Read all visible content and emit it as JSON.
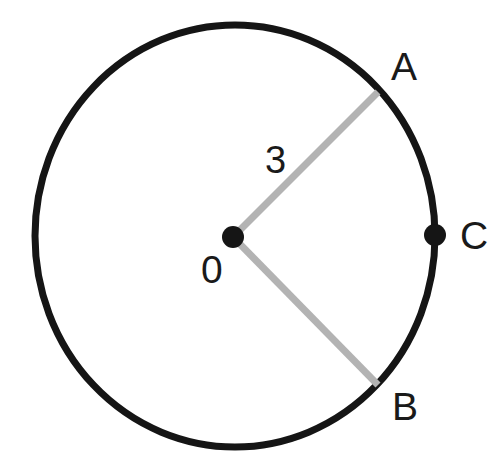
{
  "figure": {
    "type": "geometry-diagram",
    "background_color": "#ffffff"
  },
  "colors": {
    "circle_stroke": "#151515",
    "radius_stroke": "#b3b3b3",
    "point_fill": "#151515",
    "label_color": "#1a1a1a"
  },
  "circle": {
    "center_x": 235,
    "center_y": 236,
    "radius_x": 200,
    "radius_y": 211,
    "stroke_width": 7
  },
  "points": {
    "center": {
      "name": "O",
      "label": "0",
      "x": 233,
      "y": 237,
      "dot_radius": 11,
      "label_x": 213,
      "label_y": 270
    },
    "a": {
      "name": "A",
      "label": "A",
      "x": 378,
      "y": 92,
      "label_x": 404,
      "label_y": 66
    },
    "b": {
      "name": "B",
      "label": "B",
      "x": 378,
      "y": 385,
      "label_x": 404,
      "label_y": 406
    },
    "c": {
      "name": "C",
      "label": "C",
      "x": 435,
      "y": 235,
      "dot_radius": 11,
      "label_x": 472,
      "label_y": 235
    }
  },
  "segments": [
    {
      "name": "radius-OA",
      "from": "O",
      "to": "A",
      "x1": 233,
      "y1": 237,
      "x2": 378,
      "y2": 92,
      "stroke_width": 7,
      "length_label": "3"
    },
    {
      "name": "radius-OB",
      "from": "O",
      "to": "B",
      "x1": 233,
      "y1": 237,
      "x2": 378,
      "y2": 385,
      "stroke_width": 7,
      "length_label": ""
    }
  ],
  "labels": {
    "point_a": "A",
    "point_b": "B",
    "point_c": "C",
    "center_o": "0",
    "radius_length": "3"
  }
}
